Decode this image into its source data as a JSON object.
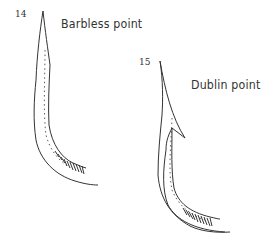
{
  "figures": [
    {
      "number": "14",
      "label": "Barbless point"
    },
    {
      "number": "15",
      "label": "Dublin point"
    }
  ],
  "colors": {
    "line": "#333333",
    "background": "#ffffff"
  }
}
